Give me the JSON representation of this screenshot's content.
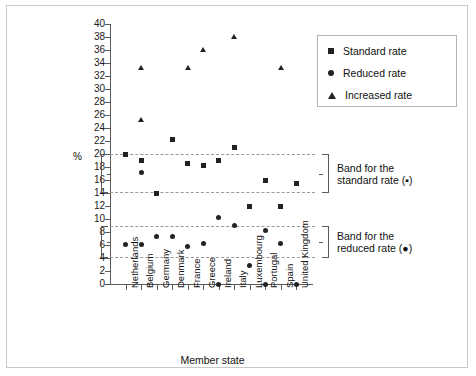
{
  "chart_data": {
    "type": "scatter",
    "title": "",
    "xlabel": "Member state",
    "ylabel": "%",
    "ylim": [
      0,
      40
    ],
    "ytick_step": 2,
    "yticks": [
      0,
      2,
      4,
      6,
      8,
      10,
      12,
      14,
      16,
      18,
      20,
      22,
      24,
      26,
      28,
      30,
      32,
      34,
      36,
      38,
      40
    ],
    "grid": false,
    "legend_position": "top-right",
    "categories": [
      "Netherlands",
      "Belgium",
      "Germany",
      "Denmark",
      "France",
      "Greece",
      "Ireland",
      "Italy",
      "Luxembourg",
      "Portugal",
      "Spain",
      "United Kingdom"
    ],
    "series": [
      {
        "name": "Standard rate",
        "marker": "square",
        "values": [
          20.0,
          19.0,
          14.0,
          22.3,
          18.6,
          18.2,
          19.0,
          21.0,
          12.0,
          16.0,
          12.0,
          15.5
        ]
      },
      {
        "name": "Reduced rate",
        "marker": "circle",
        "values": [
          6.1,
          6.1,
          7.3,
          7.3,
          5.7,
          6.3,
          10.3,
          9.0,
          2.9,
          8.3,
          6.2,
          0.0
        ]
      },
      {
        "name": "Increased rate",
        "marker": "triangle",
        "values": [
          null,
          33.3,
          null,
          null,
          33.3,
          36.0,
          null,
          38.0,
          null,
          null,
          33.3,
          null
        ]
      }
    ],
    "extra_points": [
      {
        "series": "Increased rate",
        "category": "Belgium",
        "value": 25.2,
        "marker": "triangle"
      },
      {
        "series": "Reduced rate",
        "category": "Belgium",
        "value": 17.2,
        "marker": "circle"
      },
      {
        "series": "Reduced rate",
        "category": "Ireland",
        "value": 0.0,
        "marker": "circle"
      },
      {
        "series": "Reduced rate",
        "category": "Portugal",
        "value": 0.0,
        "marker": "circle"
      }
    ],
    "bands": [
      {
        "name": "standard",
        "label_line1": "Band for the",
        "label_line2": "standard rate (▪)",
        "min": 14,
        "max": 20
      },
      {
        "name": "reduced",
        "label_line1": "Band for the",
        "label_line2": "reduced rate (●)",
        "min": 4,
        "max": 9
      }
    ],
    "annotations": []
  },
  "legend": {
    "items": [
      {
        "label": "Standard rate",
        "marker": "square"
      },
      {
        "label": "Reduced  rate",
        "marker": "circle"
      },
      {
        "label": "Increased rate",
        "marker": "triangle"
      }
    ]
  },
  "axis": {
    "y_unit_label": "%",
    "x_title": "Member state"
  }
}
